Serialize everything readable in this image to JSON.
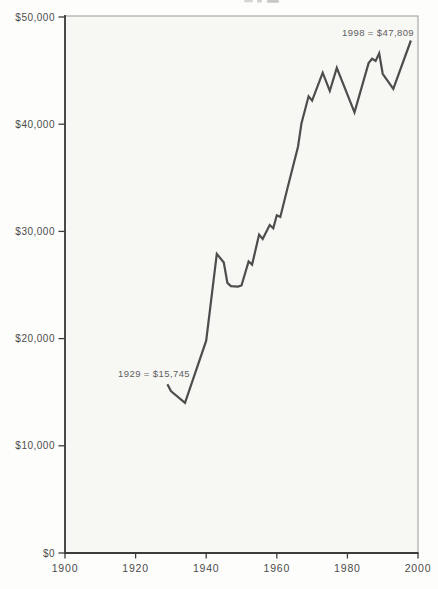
{
  "chart_data": {
    "type": "line",
    "title": "",
    "xlabel": "",
    "ylabel": "",
    "xlim": [
      1900,
      2000
    ],
    "ylim": [
      0,
      50000
    ],
    "grid": false,
    "legend": false,
    "x_ticks": [
      {
        "value": 1900,
        "label": "1900"
      },
      {
        "value": 1920,
        "label": "1920"
      },
      {
        "value": 1940,
        "label": "1940"
      },
      {
        "value": 1960,
        "label": "1960"
      },
      {
        "value": 1980,
        "label": "1980"
      },
      {
        "value": 2000,
        "label": "2000"
      }
    ],
    "y_ticks": [
      {
        "value": 0,
        "label": "$0"
      },
      {
        "value": 10000,
        "label": "$10,000"
      },
      {
        "value": 20000,
        "label": "$20,000"
      },
      {
        "value": 30000,
        "label": "$30,000"
      },
      {
        "value": 40000,
        "label": "$40,000"
      },
      {
        "value": 50000,
        "label": "$50,000"
      }
    ],
    "series": [
      {
        "name": "real-income",
        "color": "#4d4d4d",
        "points": [
          [
            1929,
            15745
          ],
          [
            1930,
            15100
          ],
          [
            1934,
            14000
          ],
          [
            1940,
            19800
          ],
          [
            1943,
            27900
          ],
          [
            1945,
            27100
          ],
          [
            1946,
            25200
          ],
          [
            1947,
            24900
          ],
          [
            1949,
            24850
          ],
          [
            1950,
            24950
          ],
          [
            1952,
            27200
          ],
          [
            1953,
            26900
          ],
          [
            1955,
            29700
          ],
          [
            1956,
            29300
          ],
          [
            1958,
            30600
          ],
          [
            1959,
            30300
          ],
          [
            1960,
            31500
          ],
          [
            1961,
            31350
          ],
          [
            1963,
            34000
          ],
          [
            1966,
            37900
          ],
          [
            1967,
            40100
          ],
          [
            1969,
            42600
          ],
          [
            1970,
            42200
          ],
          [
            1973,
            44800
          ],
          [
            1975,
            43100
          ],
          [
            1977,
            45250
          ],
          [
            1982,
            41100
          ],
          [
            1986,
            45700
          ],
          [
            1987,
            46100
          ],
          [
            1988,
            45900
          ],
          [
            1989,
            46600
          ],
          [
            1990,
            44700
          ],
          [
            1993,
            43300
          ],
          [
            1998,
            47809
          ]
        ]
      }
    ],
    "annotations": [
      {
        "text": "1929 = $15,745",
        "year": 1929,
        "value": 15745
      },
      {
        "text": "1998 = $47,809",
        "year": 1998,
        "value": 47809
      }
    ]
  }
}
